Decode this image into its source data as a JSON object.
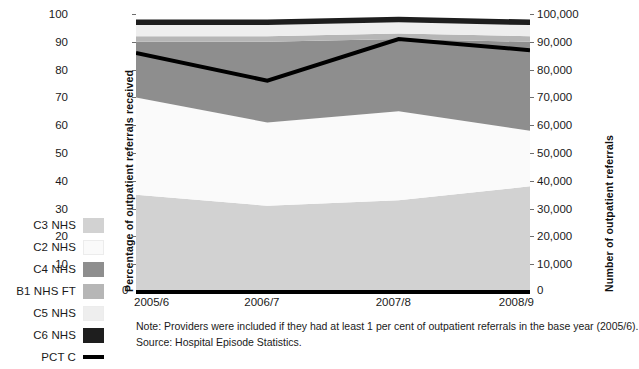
{
  "chart_data": {
    "type": "area",
    "title": "",
    "xlabel": "",
    "ylabel": "Percentage of outpatient referrals received",
    "y2label": "Number of outpatient referrals",
    "categories": [
      "2005/6",
      "2006/7",
      "2007/8",
      "2008/9"
    ],
    "ylim": [
      0,
      100
    ],
    "yticks": [
      "0",
      "10",
      "20",
      "30",
      "40",
      "50",
      "60",
      "70",
      "80",
      "90",
      "100"
    ],
    "y2lim": [
      0,
      100000
    ],
    "y2ticks": [
      "0",
      "10,000",
      "20,000",
      "30,000",
      "40,000",
      "50,000",
      "60,000",
      "70,000",
      "80,000",
      "90,000",
      "100,000"
    ],
    "grid": false,
    "legend_position": "left",
    "stacked": true,
    "series": [
      {
        "name": "C3 NHS",
        "color": "#d2d2d2",
        "values": [
          35,
          31,
          33,
          38
        ]
      },
      {
        "name": "C2 NHS",
        "color": "#fafafa",
        "values": [
          35,
          30,
          32,
          20
        ]
      },
      {
        "name": "C4 NHS",
        "color": "#8e8e8e",
        "values": [
          20,
          29,
          26,
          32
        ]
      },
      {
        "name": "B1 NHS FT",
        "color": "#b6b6b6",
        "values": [
          2,
          2,
          2,
          2
        ]
      },
      {
        "name": "C5 NHS",
        "color": "#eeeeee",
        "values": [
          4,
          4,
          4,
          4
        ]
      },
      {
        "name": "C6 NHS",
        "color": "#1e1e1e",
        "values": [
          2,
          2,
          2,
          2
        ]
      }
    ],
    "line_series": {
      "name": "PCT C",
      "color": "#000000",
      "axis": "right",
      "values": [
        86,
        76,
        91,
        87
      ],
      "values_absolute": [
        86000,
        76000,
        91000,
        87000
      ]
    },
    "annotations": [
      "Note: Providers were included if they had at least 1 per cent of outpatient referrals in the base year (2005/6).",
      "Source: Hospital Episode Statistics."
    ]
  },
  "legend": {
    "items": [
      {
        "label": "C3 NHS",
        "swatch": "legend-swatch-c3-nhs",
        "type": "area"
      },
      {
        "label": "C2 NHS",
        "swatch": "legend-swatch-c2-nhs",
        "type": "area"
      },
      {
        "label": "C4 NHS",
        "swatch": "legend-swatch-c4-nhs",
        "type": "area"
      },
      {
        "label": "B1 NHS FT",
        "swatch": "legend-swatch-b1-nhs-ft",
        "type": "area"
      },
      {
        "label": "C5 NHS",
        "swatch": "legend-swatch-c5-nhs",
        "type": "area"
      },
      {
        "label": "C6 NHS",
        "swatch": "legend-swatch-c6-nhs",
        "type": "area"
      },
      {
        "label": "PCT C",
        "swatch": "legend-swatch-pct-c",
        "type": "line"
      }
    ]
  },
  "axes": {
    "left_title": "Percentage of outpatient referrals received",
    "right_title": "Number of outpatient referrals",
    "zero_left": "0",
    "zero_right": "0"
  },
  "notes": {
    "note": "Note: Providers were included if they had at least 1 per cent of outpatient referrals in the base year (2005/6).",
    "source": "Source: Hospital Episode Statistics."
  }
}
